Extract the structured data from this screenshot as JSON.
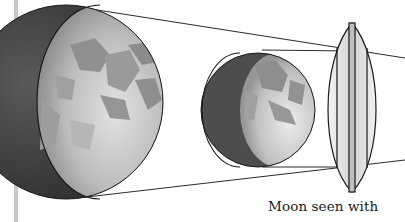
{
  "diagram": {
    "caption": "Moon seen with",
    "elements": {
      "large_moon": "moon-large",
      "small_moon": "moon-small",
      "lens": "convex-lens",
      "rays": "light-rays"
    },
    "colors": {
      "background": "#ffffff",
      "moon_dark_side": "#4a4a4a",
      "moon_light_side": "#c4c4c4",
      "maria": "#8f8f8f",
      "outline": "#1a1a1a",
      "lens_glass": "#e4e4e4",
      "margin_bar": "#c8c8c8"
    }
  }
}
